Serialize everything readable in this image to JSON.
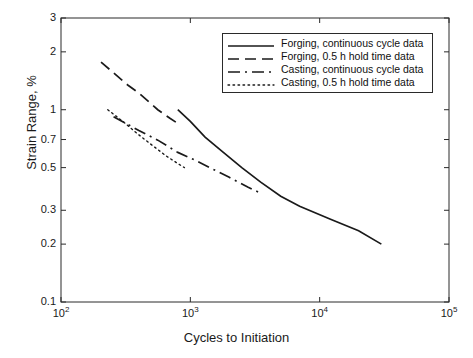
{
  "chart_data": {
    "type": "line",
    "title": "",
    "xlabel": "Cycles to Initiation",
    "ylabel": "Strain Range, %",
    "xscale": "log",
    "yscale": "log",
    "xlim": [
      100,
      100000
    ],
    "ylim": [
      0.1,
      3
    ],
    "xticks": [
      100,
      1000,
      10000,
      100000
    ],
    "xticklabels": [
      "10²",
      "10³",
      "10⁴",
      "10⁵"
    ],
    "yticks": [
      0.1,
      0.2,
      0.3,
      0.5,
      0.7,
      1,
      2,
      3
    ],
    "yticklabels": [
      "0.1",
      "0.2",
      "0.3",
      "0.5",
      "0.7",
      "1",
      "2",
      "3"
    ],
    "grid": false,
    "legend_position": "upper right",
    "series": [
      {
        "name": "Forging, continuous cycle data",
        "style": "solid",
        "color": "#1a1a1a",
        "x": [
          800,
          1000,
          1300,
          1800,
          2500,
          3500,
          5000,
          7000,
          12000,
          20000,
          30000
        ],
        "y": [
          1.0,
          0.87,
          0.72,
          0.6,
          0.5,
          0.42,
          0.355,
          0.315,
          0.27,
          0.235,
          0.2
        ]
      },
      {
        "name": "Forging, 0.5 h hold time data",
        "style": "dashed",
        "color": "#1a1a1a",
        "x": [
          204,
          330,
          400,
          560,
          700,
          820
        ],
        "y": [
          1.77,
          1.34,
          1.22,
          1.0,
          0.9,
          0.84
        ]
      },
      {
        "name": "Casting, continuous cycle data",
        "style": "dashdot",
        "color": "#1a1a1a",
        "x": [
          255,
          400,
          560,
          800,
          1100,
          1500,
          2000,
          2800,
          3600
        ],
        "y": [
          0.92,
          0.78,
          0.695,
          0.6,
          0.545,
          0.49,
          0.445,
          0.395,
          0.365
        ]
      },
      {
        "name": "Casting, 0.5 h hold time data",
        "style": "dotted",
        "color": "#1a1a1a",
        "x": [
          230,
          300,
          400,
          520,
          650,
          800,
          900
        ],
        "y": [
          1.0,
          0.87,
          0.74,
          0.645,
          0.575,
          0.525,
          0.5
        ]
      }
    ]
  },
  "axes": {
    "xlabel": "Cycles to Initiation",
    "ylabel": "Strain Range, %",
    "xticklabels": [
      "10",
      "10",
      "10",
      "10"
    ],
    "xtickexponents": [
      "2",
      "3",
      "4",
      "5"
    ],
    "yticklabels": [
      "3",
      "2",
      "1",
      "0.7",
      "0.5",
      "0.3",
      "0.2",
      "0.1"
    ]
  },
  "legend": {
    "items": [
      {
        "label": "Forging, continuous cycle data",
        "style": "solid"
      },
      {
        "label": "Forging, 0.5 h hold time data",
        "style": "dashed"
      },
      {
        "label": "Casting, continuous cycle data",
        "style": "dashdot"
      },
      {
        "label": "Casting, 0.5 h hold time data",
        "style": "dotted"
      }
    ]
  }
}
